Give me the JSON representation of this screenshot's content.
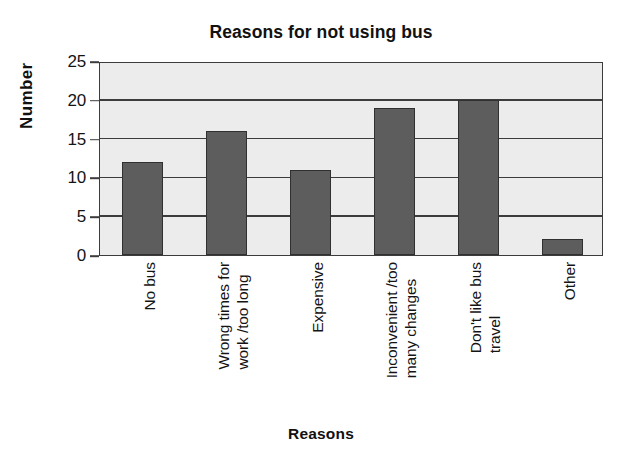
{
  "chart_data": {
    "type": "bar",
    "title": "Reasons for not using bus",
    "xlabel": "Reasons",
    "ylabel": "Number",
    "categories": [
      "No bus",
      "Wrong times for work /too long",
      "Expensive",
      "Inconvenient /too many changes",
      "Don't like bus travel",
      "Other"
    ],
    "category_lines": [
      [
        "No bus",
        ""
      ],
      [
        "Wrong times for",
        "work /too long"
      ],
      [
        "Expensive",
        ""
      ],
      [
        "Inconvenient /too",
        "many changes"
      ],
      [
        "Don't like bus",
        "travel"
      ],
      [
        "Other",
        ""
      ]
    ],
    "values": [
      12,
      16,
      11,
      19,
      20,
      2
    ],
    "ylim": [
      0,
      25
    ],
    "yticks": [
      0,
      5,
      10,
      15,
      20,
      25
    ],
    "ytick_labels": [
      "0",
      "5",
      "10",
      "15",
      "20",
      "25"
    ],
    "grid": true,
    "grid_axis": "y",
    "legend": false,
    "bar_color": "#5d5d5d",
    "bar_edge_color": "#303030",
    "plot_background": "#ececec",
    "axis_color": "#3c3c3c",
    "text_color": "#141414"
  }
}
